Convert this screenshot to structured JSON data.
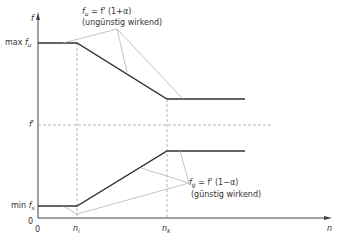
{
  "diagram": {
    "axes": {
      "y_label": "f",
      "x_label": "n",
      "origin_x": "0",
      "origin_y": "0"
    },
    "y_ticks": {
      "max": {
        "prefix": "max",
        "var": "f",
        "sub": "u"
      },
      "mid": {
        "var": "f'"
      },
      "min": {
        "prefix": "min",
        "var": "f",
        "sub": "s"
      }
    },
    "x_ticks": {
      "n1": {
        "var": "n",
        "sub": "i"
      },
      "nk": {
        "var": "n",
        "sub": "k"
      }
    },
    "upper_annotation": {
      "var": "f",
      "sub": "u",
      "formula": "= f' (1+α)",
      "note": "(ungünstig wirkend)"
    },
    "lower_annotation": {
      "var": "f",
      "sub": "g",
      "formula": "= f' (1−α)",
      "note": "(günstig wirkend)"
    },
    "colors": {
      "curve": "#333333",
      "axis": "#444444",
      "leader": "#aaaaaa",
      "dashed": "#999999"
    }
  }
}
